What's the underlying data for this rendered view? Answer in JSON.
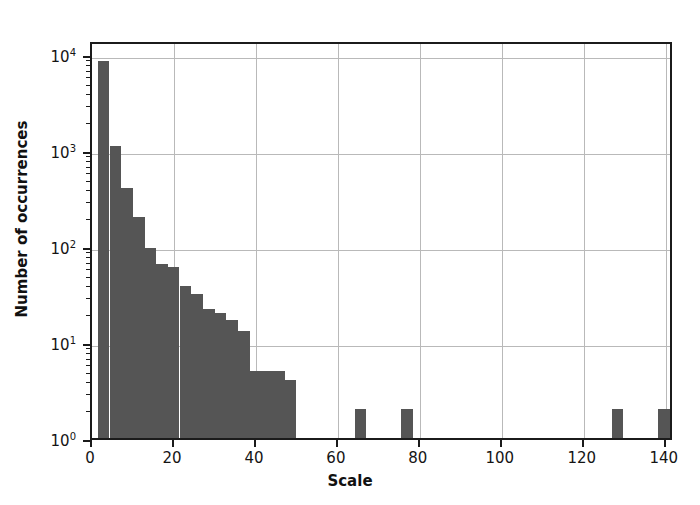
{
  "chart_data": {
    "type": "bar",
    "title": "",
    "subtitle": "",
    "xlabel": "Scale",
    "ylabel": "Number of occurrences",
    "yscale": "log",
    "xlim": [
      0,
      142
    ],
    "ylim": [
      1,
      14000
    ],
    "grid": true,
    "legend": null,
    "bar_color": "#555555",
    "bin_width": 2.84,
    "xticks": [
      0,
      20,
      40,
      60,
      80,
      100,
      120,
      140
    ],
    "xticklabels": [
      "0",
      "20",
      "40",
      "60",
      "80",
      "100",
      "120",
      "140"
    ],
    "yticks": [
      1,
      10,
      100,
      1000,
      10000
    ],
    "yticklabels": [
      "10⁰",
      "10¹",
      "10²",
      "10³",
      "10⁴"
    ],
    "ytick_bases": [
      "10",
      "10",
      "10",
      "10",
      "10"
    ],
    "ytick_exponents": [
      "0",
      "1",
      "2",
      "3",
      "4"
    ],
    "bin_starts": [
      1.4,
      4.3,
      7.1,
      10.0,
      12.8,
      15.7,
      18.5,
      21.4,
      24.2,
      27.1,
      29.9,
      32.8,
      35.6,
      38.5,
      41.3,
      44.2,
      47.0,
      49.9,
      52.7,
      55.6,
      58.4,
      61.3,
      64.1,
      67.0,
      69.8,
      72.7,
      75.5,
      78.4,
      81.2,
      84.1,
      86.9,
      89.8,
      92.6,
      95.5,
      98.3,
      101.2,
      104.0,
      106.9,
      109.7,
      112.6,
      115.4,
      118.3,
      121.1,
      124.0,
      126.8,
      129.7,
      132.5,
      135.4,
      138.2,
      141.1
    ],
    "values": [
      8500,
      1100,
      400,
      200,
      95,
      65,
      60,
      38,
      32,
      22,
      20,
      17,
      13,
      5,
      5,
      5,
      4,
      0,
      0,
      0,
      0,
      1,
      2,
      0,
      0,
      1,
      2,
      1,
      0,
      0,
      0,
      0,
      0,
      0,
      0,
      0,
      0,
      0,
      0,
      0,
      0,
      0,
      0,
      0,
      2,
      0,
      0,
      0,
      2,
      0
    ],
    "categories": [
      "1.4",
      "4.3",
      "7.1",
      "10.0",
      "12.8",
      "15.7",
      "18.5",
      "21.4",
      "24.2",
      "27.1",
      "29.9",
      "32.8",
      "35.6",
      "38.5",
      "41.3",
      "44.2",
      "47.0",
      "49.9",
      "52.7",
      "55.6",
      "58.4",
      "61.3",
      "64.1",
      "67.0",
      "69.8",
      "72.7",
      "75.5",
      "78.4",
      "81.2",
      "84.1",
      "86.9",
      "89.8",
      "92.6",
      "95.5",
      "98.3",
      "101.2",
      "104.0",
      "106.9",
      "109.7",
      "112.6",
      "115.4",
      "118.3",
      "121.1",
      "124.0",
      "126.8",
      "129.7",
      "132.5",
      "135.4",
      "138.2",
      "141.1"
    ]
  }
}
